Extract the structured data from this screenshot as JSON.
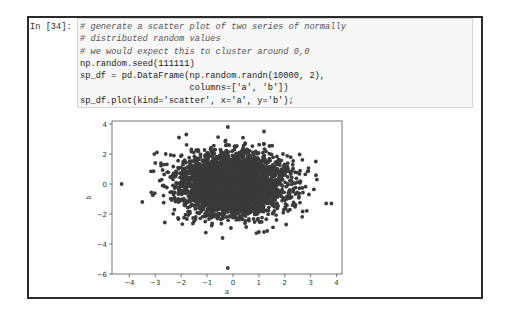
{
  "cell": {
    "prompt": "In [34]:",
    "code_lines": [
      {
        "text": "# generate a scatter plot of two series of normally",
        "kind": "comment"
      },
      {
        "text": "# distributed random values",
        "kind": "comment"
      },
      {
        "text": "# we would expect this to cluster around 0,0",
        "kind": "comment"
      },
      {
        "text": "np.random.seed(111111)",
        "kind": "code"
      },
      {
        "text": "sp_df = pd.DataFrame(np.random.randn(10000, 2),",
        "kind": "code"
      },
      {
        "text": "                     columns=['a', 'b'])",
        "kind": "code"
      },
      {
        "text": "sp_df.plot(kind='scatter', x='a', y='b');",
        "kind": "code"
      }
    ]
  },
  "colors": {
    "frame_border": "#2a2a2a",
    "code_bg": "#f7f7f7",
    "code_border": "#d6d6d6",
    "marker": "#3a3a3a",
    "axis": "#555555"
  },
  "chart_data": {
    "type": "scatter",
    "title": "",
    "xlabel": "a",
    "ylabel": "b",
    "xlim": [
      -4.67,
      4.21
    ],
    "ylim": [
      -6.0,
      4.2
    ],
    "xticks": [
      -4,
      -3,
      -2,
      -1,
      0,
      1,
      2,
      3,
      4
    ],
    "yticks": [
      -6,
      -4,
      -2,
      0,
      2,
      4
    ],
    "grid": false,
    "legend": null,
    "series": [
      {
        "name": "b vs a",
        "generator": {
          "distribution": "standard_normal",
          "n": 10000,
          "mean": [
            0,
            0
          ],
          "std": [
            1,
            1
          ],
          "seed": 111111
        },
        "notable_points": [
          {
            "a": -4.3,
            "b": 0.0
          },
          {
            "a": -0.2,
            "b": 3.8
          },
          {
            "a": -0.2,
            "b": -5.6
          },
          {
            "a": -0.4,
            "b": -3.6
          },
          {
            "a": 3.6,
            "b": -1.3
          },
          {
            "a": 3.8,
            "b": -1.3
          },
          {
            "a": 3.2,
            "b": 1.5
          },
          {
            "a": 1.2,
            "b": 3.5
          },
          {
            "a": -1.8,
            "b": 3.3
          },
          {
            "a": -3.5,
            "b": -1.2
          },
          {
            "a": -3.0,
            "b": 1.4
          },
          {
            "a": 1.0,
            "b": -3.2
          },
          {
            "a": 1.2,
            "b": -3.2
          }
        ]
      }
    ],
    "plot_box_px": {
      "left": 112,
      "top": 121,
      "right": 342,
      "bottom": 274
    }
  }
}
